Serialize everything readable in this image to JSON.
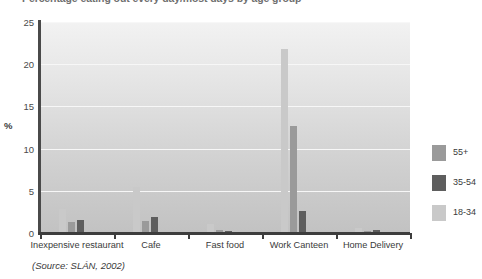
{
  "chart_data": {
    "type": "bar",
    "title": "Percentage eating out every day/most days by age group",
    "xlabel": "",
    "ylabel": "%",
    "ylim": [
      0,
      25
    ],
    "yticks": [
      0,
      5,
      10,
      15,
      20,
      25
    ],
    "grid": true,
    "legend_position": "right",
    "categories": [
      "Inexpensive restaurant",
      "Cafe",
      "Fast food",
      "Work Canteen",
      "Home Delivery"
    ],
    "series": [
      {
        "name": "55+",
        "color": "#9a9a9a",
        "values": [
          1.3,
          1.4,
          0.3,
          12.7,
          0.2
        ]
      },
      {
        "name": "35-54",
        "color": "#5e5e5e",
        "values": [
          1.6,
          1.9,
          0.2,
          2.6,
          0.4
        ]
      },
      {
        "name": "18-34",
        "color": "#c9c9c9",
        "values": [
          2.8,
          5.4,
          1.1,
          21.8,
          0.6
        ]
      }
    ],
    "source": "(Source: SLÁN, 2002)"
  },
  "legend": {
    "items": [
      {
        "label": "55+"
      },
      {
        "label": "35-54"
      },
      {
        "label": "18-34"
      }
    ]
  },
  "axis": {
    "y_label": "%",
    "y_ticks": [
      "0",
      "5",
      "10",
      "15",
      "20",
      "25"
    ]
  },
  "footer": {
    "source": "(Source: SLÁN, 2002)"
  }
}
